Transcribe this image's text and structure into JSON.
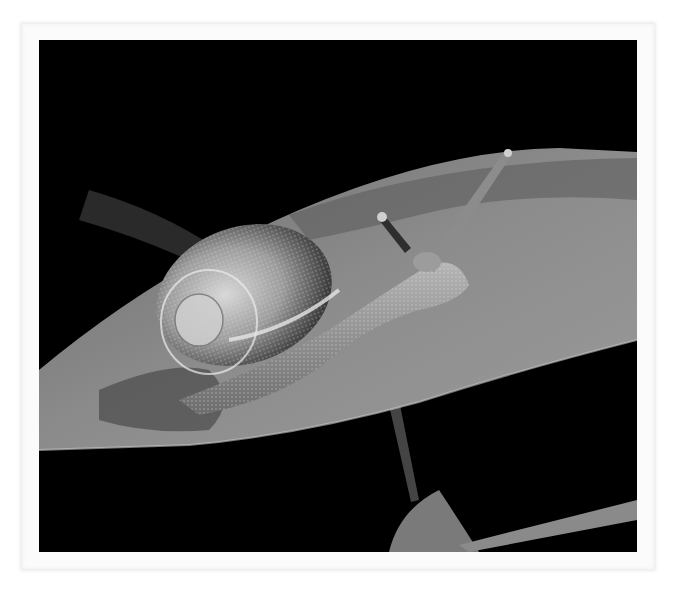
{
  "image": {
    "subject": "Snail crawling on a leaf",
    "style": "black-and-white photograph",
    "description": "A garden snail with a textured spiral shell crawls across a broad leaf, eye stalks extended, against a black background.",
    "colors": {
      "background": "#000000",
      "leaf": "#8a8a8a",
      "leaf_shadow": "#5a5a5a",
      "shell": "#b8b8b8",
      "body": "#9a9a9a",
      "frame": "#fbfbfb"
    }
  },
  "caption": {
    "text": "",
    "note": "partially visible text cut off at bottom edge"
  }
}
